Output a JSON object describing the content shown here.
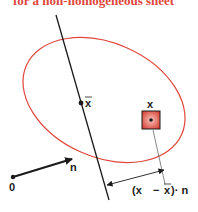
{
  "title": "for a non-homogeneous sheet",
  "labels": {
    "mean_point": "x",
    "point": "x",
    "origin": "0",
    "normal": "n",
    "distance_open": "(x",
    "distance_minus": "−",
    "distance_xbar": "x",
    "distance_close": ")· n"
  },
  "colors": {
    "ellipse": "#e0463a",
    "line": "#1a1a1a",
    "title": "#e0463a",
    "element_fill": "#e86a5e"
  }
}
